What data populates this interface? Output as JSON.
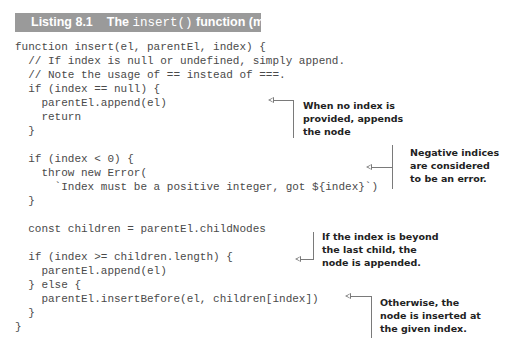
{
  "listing": {
    "number": "Listing 8.1",
    "title_prefix": "The ",
    "title_code": "insert()",
    "title_suffix": " function (mount-dom.js)"
  },
  "code_lines": [
    "function insert(el, parentEl, index) {",
    "  // If index is null or undefined, simply append.",
    "  // Note the usage of == instead of ===.",
    "  if (index == null) {",
    "    parentEl.append(el)",
    "    return",
    "  }",
    "",
    "  if (index < 0) {",
    "    throw new Error(",
    "      `Index must be a positive integer, got ${index}`)",
    "  }",
    "",
    "  const children = parentEl.childNodes",
    "",
    "  if (index >= children.length) {",
    "    parentEl.append(el)",
    "  } else {",
    "    parentEl.insertBefore(el, children[index])",
    "  }",
    "}"
  ],
  "annotations": [
    {
      "text": "When no index is\nprovided, appends\nthe node"
    },
    {
      "text": "Negative indices\nare considered\nto be an error."
    },
    {
      "text": "If the index is beyond\nthe last child, the\nnode is appended."
    },
    {
      "text": "Otherwise, the\nnode is inserted at\nthe given index."
    }
  ]
}
